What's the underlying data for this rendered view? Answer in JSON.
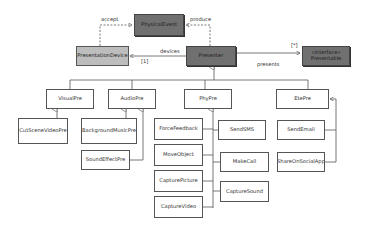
{
  "diagram": {
    "type": "uml-class-diagram",
    "classes": {
      "physical_event": "PhysicalEvent",
      "presentation_device": "PresentationDevice",
      "presenter": "Presenter",
      "presentable_stereotype": "«interface»",
      "presentable": "Presentable",
      "visual_pre": "VisualPre",
      "audio_pre": "AudioPre",
      "phy_pre": "PhyPre",
      "ete_pre": "EtePre",
      "cut_scene_video_pre": "CutSceneVideoPre",
      "background_music_pre": "BackgroundMusicPre",
      "sound_effect_pre": "SoundEffectPre",
      "force_feedback": "ForceFeedback",
      "move_object": "MoveObject",
      "capture_picture": "CapturePicture",
      "capture_video": "CaptureVideo",
      "send_sms": "SendSMS",
      "make_call": "MakeCall",
      "capture_sound": "CaptureSound",
      "send_email": "SendEmail",
      "share_on_social_app": "ShareOnSocialApp"
    },
    "relations": {
      "accept": "accept",
      "produce": "produce",
      "devices": "devices",
      "devices_multiplicity": "[1]",
      "presents": "presents",
      "presents_multiplicity": "[*]"
    },
    "colors": {
      "dark_box": "#707070",
      "light_box": "#bdbdbd",
      "line": "#555555"
    }
  }
}
